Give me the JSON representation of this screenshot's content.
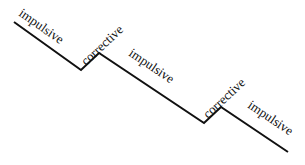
{
  "diagram": {
    "title": "",
    "line_color": "#111111",
    "background": "#ffffff",
    "vertices": [
      [
        14,
        22
      ],
      [
        81,
        70
      ],
      [
        99,
        53
      ],
      [
        204,
        123
      ],
      [
        221,
        107
      ],
      [
        288,
        152
      ]
    ],
    "segments": [
      {
        "label": "impulsive",
        "type": "impulsive",
        "x": 18,
        "y": 15,
        "angle": 35
      },
      {
        "label": "corrective",
        "type": "corrective",
        "x": 83,
        "y": 66,
        "angle": -43
      },
      {
        "label": "impulsive",
        "type": "impulsive",
        "x": 128,
        "y": 55,
        "angle": 34
      },
      {
        "label": "corrective",
        "type": "corrective",
        "x": 205,
        "y": 118,
        "angle": -43
      },
      {
        "label": "impulsive",
        "type": "impulsive",
        "x": 246,
        "y": 108,
        "angle": 34
      }
    ]
  }
}
